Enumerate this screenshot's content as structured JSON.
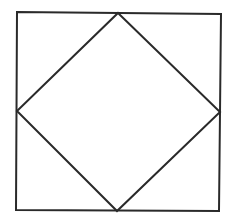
{
  "diagram": {
    "stroke_color": "#2a2a2a",
    "background": "#ffffff",
    "outer_square": {
      "points": [
        [
          17,
          12
        ],
        [
          221,
          14
        ],
        [
          219,
          211
        ],
        [
          16,
          210
        ]
      ]
    },
    "inner_diamond": {
      "points": [
        [
          118,
          13
        ],
        [
          220,
          112
        ],
        [
          117,
          211
        ],
        [
          17,
          111
        ]
      ]
    }
  }
}
